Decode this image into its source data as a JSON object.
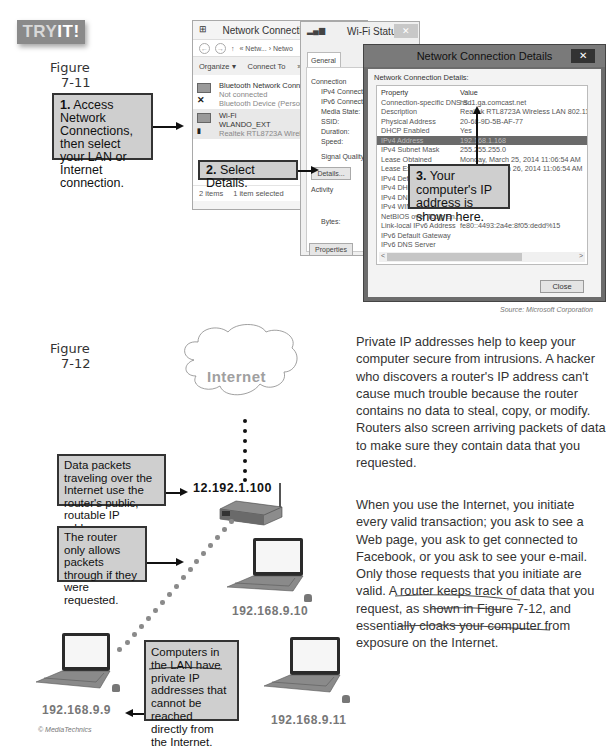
{
  "badge": {
    "try": "TRY",
    "it": "IT!"
  },
  "figure_7_11": {
    "label_word": "Figure",
    "label_num": "7-11",
    "callouts": [
      {
        "step": "1.",
        "text": " Access Network Connections, then select your LAN or Internet connection."
      },
      {
        "step": "2.",
        "text": " Select Details."
      },
      {
        "step": "3.",
        "text": " Your computer's IP address is shown here."
      }
    ],
    "network_connections_window": {
      "title": "Network Connections",
      "minimize": "–",
      "maximize": "☐",
      "close": "✕",
      "address_bar": "« Netw... › Netwo",
      "toolbar": {
        "organize": "Organize ▾",
        "connect_to": "Connect To",
        "more": "»"
      },
      "items": [
        {
          "name": "Bluetooth Network Connection",
          "status": "Not connected",
          "device": "Bluetooth Device (Personal Ar",
          "selected": false
        },
        {
          "name": "Wi-Fi",
          "status": "WLANDO_EXT",
          "device": "Realtek RTL8723A Wireless LA",
          "selected": true
        }
      ],
      "status_bar": {
        "count": "2 items",
        "selected": "1 item selected"
      }
    },
    "wifi_status_window": {
      "title": "Wi-Fi Status",
      "close": "✕",
      "tab": "General",
      "section_connection": "Connection",
      "fields": [
        "IPv4 Connectivity:",
        "IPv6 Connectivity:",
        "Media State:",
        "SSID:",
        "Duration:",
        "Speed:",
        "Signal Quality:"
      ],
      "details_button": "Details...",
      "section_activity": "Activity",
      "bytes_label": "Bytes:",
      "properties_button": "Properties"
    },
    "details_window": {
      "title": "Network Connection Details",
      "close": "✕",
      "subtitle": "Network Connection Details:",
      "columns": {
        "property": "Property",
        "value": "Value"
      },
      "rows": [
        {
          "property": "Connection-specific DNS S...",
          "value": "hsd1.ga.comcast.net"
        },
        {
          "property": "Description",
          "value": "Realtek RTL8723A Wireless LAN 802.11n US"
        },
        {
          "property": "Physical Address",
          "value": "20-68-9D-5B-AF-77"
        },
        {
          "property": "DHCP Enabled",
          "value": "Yes"
        },
        {
          "property": "IPv4 Address",
          "value": "192.168.1.168",
          "highlighted": true
        },
        {
          "property": "IPv4 Subnet Mask",
          "value": "255.255.255.0"
        },
        {
          "property": "Lease Obtained",
          "value": "Monday, March 25, 2014 11:06:54 AM"
        },
        {
          "property": "Lease Expires",
          "value": "Tuesday, March 26, 2014 11:06:54 AM"
        },
        {
          "property": "IPv4 Default Gateway",
          "value": ""
        },
        {
          "property": "IPv4 DHCP Server",
          "value": ""
        },
        {
          "property": "IPv4 DNS Server",
          "value": ""
        },
        {
          "property": "IPv4 WINS Server",
          "value": ""
        },
        {
          "property": "NetBIOS over Tcpip En...",
          "value": ""
        },
        {
          "property": "Link-local IPv6 Address",
          "value": "fe80::4493:2a4e:8f05:dedd%15"
        },
        {
          "property": "IPv6 Default Gateway",
          "value": ""
        },
        {
          "property": "IPv6 DNS Server",
          "value": ""
        }
      ],
      "scroll_left": "<",
      "scroll_right": ">",
      "close_button": "Close"
    },
    "source": "Source: Microsoft Corporation"
  },
  "figure_7_12": {
    "label_word": "Figure",
    "label_num": "7-12",
    "cloud_label": "Internet",
    "router_ip": "12.192.1.100",
    "computers": [
      {
        "ip": "192.168.9.10"
      },
      {
        "ip": "192.168.9.9"
      },
      {
        "ip": "192.168.9.11"
      }
    ],
    "callouts": [
      "Data packets traveling over the Internet use the router's public, routable IP address.",
      "The router only allows packets through if they were requested.",
      "Computers in the LAN have private IP addresses that cannot be reached directly from the Internet."
    ],
    "credit": "© MediaTechnics"
  },
  "body": {
    "paragraph_1": "Private IP addresses help to keep your computer secure from intrusions. A hacker who discovers a router's IP address can't cause much trouble because the router contains no data to steal, copy, or modify. Routers also screen arriving packets of data to make sure they contain data that you requested.",
    "paragraph_2": "When you use the Internet, you initiate every valid transaction; you ask to see a Web page, you ask to get connected to Facebook, or you ask to see your e-mail. Only those requests that you initiate are valid. A router keeps track of data that you request, as shown in Figure 7-12, and essentially cloaks your computer from exposure on the Internet."
  }
}
